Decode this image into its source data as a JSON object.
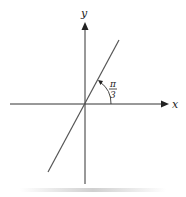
{
  "diagram": {
    "axes": {
      "x_label": "x",
      "y_label": "y"
    },
    "angle": {
      "numerator": "π",
      "denominator": "3",
      "value_radians": "π/3"
    },
    "colors": {
      "axis": "#333333",
      "line": "#555555",
      "background": "#ffffff",
      "shadow": "#d8d8d8"
    }
  }
}
